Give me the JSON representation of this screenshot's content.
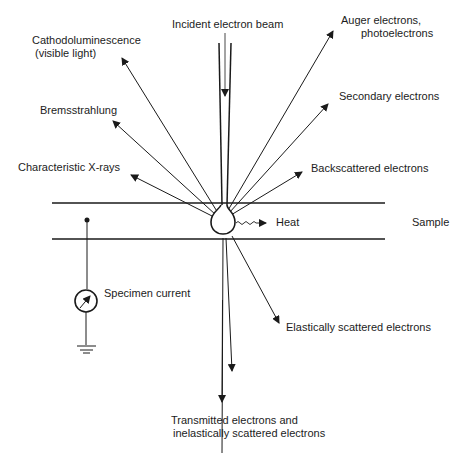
{
  "labels": {
    "incident_beam": "Incident electron beam",
    "cathodoluminescence_line1": "Cathodoluminescence",
    "cathodoluminescence_line2": "(visible light)",
    "bremsstrahlung": "Bremsstrahlung",
    "characteristic_xrays": "Characteristic X-rays",
    "auger_line1": "Auger electrons,",
    "auger_line2": "photoelectrons",
    "secondary": "Secondary electrons",
    "backscattered": "Backscattered electrons",
    "heat": "Heat",
    "sample": "Sample",
    "specimen_current": "Specimen current",
    "elastically_scattered": "Elastically scattered electrons",
    "transmitted_line1": "Transmitted electrons and",
    "transmitted_line2": "inelastically scattered electrons"
  },
  "colors": {
    "line": "#1a1a1a",
    "background": "#ffffff"
  }
}
